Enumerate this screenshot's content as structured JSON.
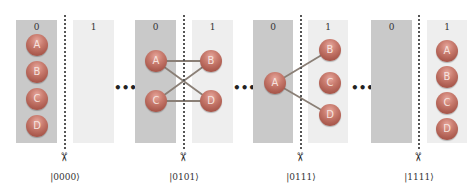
{
  "diagram": {
    "column_labels": {
      "left": "0",
      "right": "1"
    },
    "ellipsis": "•••",
    "scissors_glyph": "✂",
    "colors": {
      "partition_0": "#c9c9c9",
      "partition_1": "#eeeeee",
      "node": "#b9675a",
      "edge": "#8a7f76"
    },
    "panels": [
      {
        "ket": "|0000⟩",
        "left_nodes": [
          "A",
          "B",
          "C",
          "D"
        ],
        "right_nodes": [],
        "edges": []
      },
      {
        "ket": "|0101⟩",
        "left_nodes": [
          "A",
          "C"
        ],
        "right_nodes": [
          "B",
          "D"
        ],
        "edges": [
          [
            "A",
            "B"
          ],
          [
            "A",
            "D"
          ],
          [
            "C",
            "B"
          ],
          [
            "C",
            "D"
          ]
        ]
      },
      {
        "ket": "|0111⟩",
        "left_nodes": [
          "A"
        ],
        "right_nodes": [
          "B",
          "C",
          "D"
        ],
        "edges": [
          [
            "A",
            "B"
          ],
          [
            "A",
            "D"
          ]
        ]
      },
      {
        "ket": "|1111⟩",
        "left_nodes": [],
        "right_nodes": [
          "A",
          "B",
          "C",
          "D"
        ],
        "edges": []
      }
    ]
  }
}
